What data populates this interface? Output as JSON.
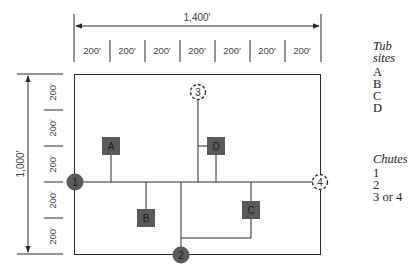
{
  "dimensions": {
    "width_total": "1,400′",
    "height_total": "1,000′",
    "width_segments": [
      "200′",
      "200′",
      "200′",
      "200′",
      "200′",
      "200′",
      "200′"
    ],
    "height_segments": [
      "200′",
      "200′",
      "200′",
      "200′",
      "200′"
    ]
  },
  "tub_sites": {
    "title_line1": "Tub",
    "title_line2": "sites",
    "items": [
      "A",
      "B",
      "C",
      "D"
    ]
  },
  "chutes": {
    "title": "Chutes",
    "items": [
      "1",
      "2",
      "3 or 4"
    ]
  },
  "nodes": {
    "chute1": "1",
    "chute2": "2",
    "chute3": "3",
    "chute4": "4",
    "tubA": "A",
    "tubB": "B",
    "tubC": "C",
    "tubD": "D"
  },
  "colors": {
    "line": "#2a2a2a",
    "fill": "#5a5a5a",
    "node_text": "#1a1a1a",
    "dim_text": "#444444"
  }
}
